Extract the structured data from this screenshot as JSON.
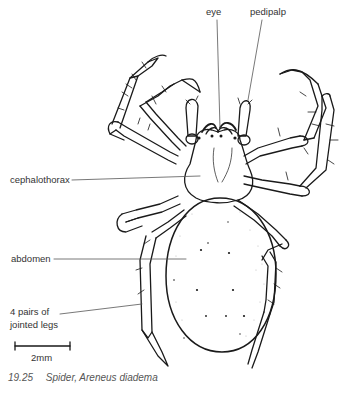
{
  "figure": {
    "number": "19.25",
    "title": "Spider, Areneus diadema"
  },
  "labels": {
    "eye": "eye",
    "pedipalp": "pedipalp",
    "cephalothorax": "cephalothorax",
    "abdomen": "abdomen",
    "legs_line1": "4 pairs of",
    "legs_line2": "jointed legs"
  },
  "scale_bar": {
    "label": "2mm"
  },
  "colors": {
    "ink": "#1a1a1a",
    "leader": "#555555",
    "background": "#ffffff"
  }
}
